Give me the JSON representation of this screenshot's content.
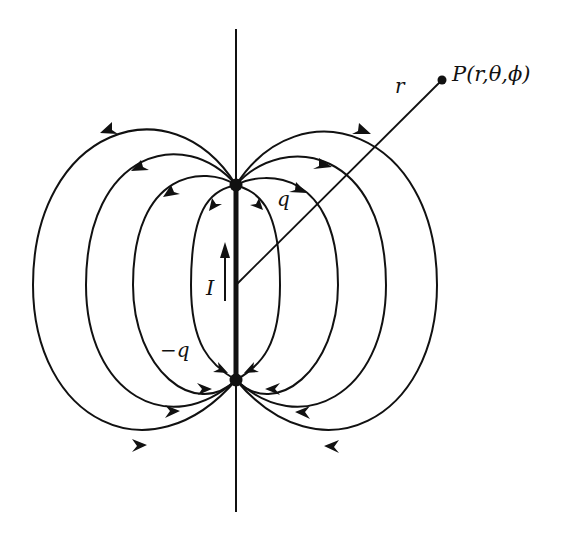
{
  "diagram": {
    "type": "electric-dipole-field-lines",
    "labels": {
      "point": "P(r,θ,ϕ)",
      "radius": "r",
      "positive_charge": "q",
      "negative_charge": "−q",
      "current": "I"
    },
    "colors": {
      "ink": "#111111",
      "background": "#ffffff"
    },
    "geometry": {
      "axis": {
        "x": 236,
        "y_top": 29,
        "y_bottom": 512
      },
      "positive_charge": {
        "x": 236,
        "y": 185
      },
      "negative_charge": {
        "x": 236,
        "y": 380
      },
      "origin": {
        "x": 236,
        "y": 285
      },
      "point_P": {
        "x": 442,
        "y": 80
      },
      "left_loop_extents_x": [
        33,
        86,
        133,
        191
      ],
      "right_loop_extents_x": [
        437,
        386,
        338,
        280
      ]
    },
    "field_line_count_per_side": 4,
    "arrow_direction": "from q (top) outward to −q (bottom)",
    "current_arrow_direction": "up"
  }
}
